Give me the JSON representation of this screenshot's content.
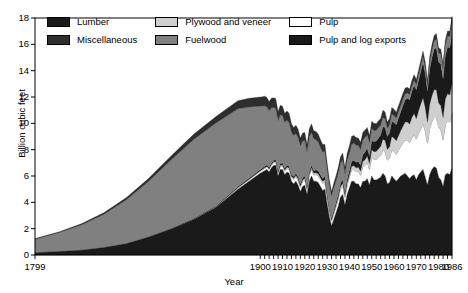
{
  "chart_data": {
    "type": "area",
    "stacked": true,
    "title": "",
    "xlabel": "Year",
    "ylabel": "Billion cubic feet",
    "xlim": [
      1799,
      1986
    ],
    "ylim": [
      0,
      18
    ],
    "yticks": [
      0,
      2,
      4,
      6,
      8,
      10,
      12,
      14,
      16,
      18
    ],
    "xticks": [
      1799,
      1900,
      1910,
      1920,
      1930,
      1940,
      1950,
      1960,
      1970,
      1980,
      1986
    ],
    "grid": false,
    "legend_position": "top-inside",
    "colors": {
      "lumber": "#1a1a1a",
      "miscellaneous": "#2e2e2e",
      "plywood_and_veneer": "#cfcfcf",
      "fuelwood": "#808080",
      "pulp": "#ffffff",
      "pulp_and_log_exports": "#1a1a1a",
      "axis": "#000000",
      "background": "#ffffff"
    },
    "stack_order_bottom_to_top": [
      "Lumber",
      "Pulp",
      "Plywood and veneer",
      "Pulp and log exports",
      "Fuelwood",
      "Miscellaneous"
    ],
    "x": [
      1799,
      1810,
      1820,
      1830,
      1840,
      1850,
      1860,
      1870,
      1880,
      1890,
      1895,
      1900,
      1901,
      1902,
      1903,
      1904,
      1905,
      1906,
      1907,
      1908,
      1909,
      1910,
      1911,
      1912,
      1913,
      1914,
      1915,
      1916,
      1917,
      1918,
      1919,
      1920,
      1921,
      1922,
      1923,
      1924,
      1925,
      1926,
      1927,
      1928,
      1929,
      1930,
      1931,
      1932,
      1933,
      1934,
      1935,
      1936,
      1937,
      1938,
      1939,
      1940,
      1941,
      1942,
      1943,
      1944,
      1945,
      1946,
      1947,
      1948,
      1949,
      1950,
      1951,
      1952,
      1953,
      1954,
      1955,
      1956,
      1957,
      1958,
      1959,
      1960,
      1961,
      1962,
      1963,
      1964,
      1965,
      1966,
      1967,
      1968,
      1969,
      1970,
      1971,
      1972,
      1973,
      1974,
      1975,
      1976,
      1977,
      1978,
      1979,
      1980,
      1981,
      1982,
      1983,
      1984,
      1985,
      1986
    ],
    "series": [
      {
        "name": "Lumber",
        "color": "#1a1a1a",
        "values": [
          0.2,
          0.3,
          0.4,
          0.6,
          0.9,
          1.4,
          2.0,
          2.7,
          3.6,
          5.0,
          5.6,
          6.2,
          6.3,
          6.4,
          6.5,
          6.3,
          6.6,
          6.8,
          6.8,
          6.0,
          6.5,
          6.5,
          6.1,
          6.3,
          6.2,
          5.6,
          5.4,
          5.6,
          5.3,
          4.8,
          5.2,
          5.3,
          4.6,
          5.6,
          6.0,
          5.6,
          5.6,
          5.5,
          5.2,
          4.9,
          5.0,
          3.9,
          2.9,
          2.2,
          2.7,
          3.2,
          3.7,
          4.4,
          4.6,
          3.8,
          4.6,
          5.1,
          5.6,
          5.6,
          5.4,
          5.4,
          5.1,
          5.6,
          5.6,
          5.8,
          5.3,
          6.0,
          5.7,
          5.7,
          5.8,
          5.9,
          6.2,
          6.0,
          5.4,
          5.5,
          6.0,
          5.8,
          5.6,
          5.8,
          6.0,
          6.1,
          6.2,
          6.0,
          5.8,
          6.0,
          6.1,
          5.7,
          6.1,
          6.3,
          6.5,
          5.9,
          5.3,
          6.1,
          6.5,
          6.7,
          6.6,
          5.9,
          5.7,
          5.2,
          6.1,
          6.2,
          6.1,
          6.6
        ]
      },
      {
        "name": "Pulp",
        "color": "#ffffff",
        "values": [
          0.0,
          0.0,
          0.0,
          0.0,
          0.0,
          0.0,
          0.0,
          0.02,
          0.05,
          0.1,
          0.12,
          0.15,
          0.16,
          0.17,
          0.18,
          0.19,
          0.2,
          0.21,
          0.22,
          0.22,
          0.24,
          0.25,
          0.26,
          0.28,
          0.3,
          0.3,
          0.32,
          0.35,
          0.36,
          0.35,
          0.38,
          0.4,
          0.38,
          0.44,
          0.48,
          0.48,
          0.5,
          0.52,
          0.52,
          0.54,
          0.56,
          0.5,
          0.42,
          0.36,
          0.42,
          0.48,
          0.54,
          0.62,
          0.66,
          0.58,
          0.7,
          0.78,
          0.88,
          0.9,
          0.92,
          0.95,
          0.95,
          1.1,
          1.2,
          1.25,
          1.2,
          1.45,
          1.55,
          1.55,
          1.6,
          1.65,
          1.8,
          1.85,
          1.8,
          1.85,
          2.0,
          2.05,
          2.05,
          2.15,
          2.25,
          2.4,
          2.55,
          2.7,
          2.75,
          2.9,
          3.05,
          3.1,
          3.15,
          3.3,
          3.5,
          3.5,
          3.2,
          3.5,
          3.65,
          3.8,
          3.9,
          3.8,
          3.8,
          3.55,
          3.8,
          4.0,
          4.0,
          4.2
        ]
      },
      {
        "name": "Plywood and veneer",
        "color": "#cfcfcf",
        "values": [
          0.0,
          0.0,
          0.0,
          0.0,
          0.0,
          0.0,
          0.0,
          0.0,
          0.0,
          0.02,
          0.03,
          0.05,
          0.05,
          0.06,
          0.06,
          0.06,
          0.07,
          0.07,
          0.08,
          0.07,
          0.08,
          0.09,
          0.09,
          0.1,
          0.1,
          0.09,
          0.1,
          0.11,
          0.11,
          0.1,
          0.11,
          0.12,
          0.11,
          0.13,
          0.14,
          0.14,
          0.15,
          0.15,
          0.15,
          0.16,
          0.16,
          0.14,
          0.12,
          0.1,
          0.12,
          0.14,
          0.16,
          0.18,
          0.19,
          0.17,
          0.2,
          0.22,
          0.26,
          0.28,
          0.3,
          0.32,
          0.32,
          0.4,
          0.44,
          0.46,
          0.45,
          0.55,
          0.6,
          0.62,
          0.66,
          0.7,
          0.8,
          0.84,
          0.82,
          0.88,
          1.0,
          1.02,
          1.02,
          1.1,
          1.18,
          1.28,
          1.35,
          1.4,
          1.4,
          1.55,
          1.6,
          1.55,
          1.7,
          1.85,
          1.95,
          1.8,
          1.6,
          1.85,
          1.95,
          2.05,
          2.05,
          1.85,
          1.85,
          1.7,
          1.95,
          2.05,
          2.05,
          2.2
        ]
      },
      {
        "name": "Pulp and log exports",
        "color": "#1a1a1a",
        "values": [
          0.0,
          0.0,
          0.0,
          0.0,
          0.0,
          0.0,
          0.02,
          0.03,
          0.05,
          0.08,
          0.09,
          0.1,
          0.1,
          0.11,
          0.11,
          0.11,
          0.12,
          0.12,
          0.13,
          0.12,
          0.13,
          0.14,
          0.14,
          0.15,
          0.15,
          0.14,
          0.15,
          0.16,
          0.16,
          0.15,
          0.17,
          0.18,
          0.16,
          0.19,
          0.2,
          0.2,
          0.21,
          0.22,
          0.22,
          0.23,
          0.24,
          0.2,
          0.17,
          0.14,
          0.17,
          0.2,
          0.23,
          0.26,
          0.28,
          0.24,
          0.3,
          0.34,
          0.38,
          0.4,
          0.42,
          0.44,
          0.44,
          0.52,
          0.58,
          0.6,
          0.58,
          0.7,
          0.76,
          0.78,
          0.82,
          0.86,
          0.95,
          1.0,
          0.98,
          1.05,
          1.15,
          1.2,
          1.22,
          1.35,
          1.45,
          1.6,
          1.7,
          1.8,
          1.85,
          2.0,
          2.15,
          2.2,
          2.3,
          2.5,
          2.7,
          2.6,
          2.35,
          2.7,
          2.9,
          3.1,
          3.2,
          3.1,
          3.15,
          2.95,
          3.3,
          3.55,
          3.6,
          3.85
        ]
      },
      {
        "name": "Fuelwood",
        "color": "#808080",
        "values": [
          1.0,
          1.4,
          1.9,
          2.5,
          3.3,
          4.2,
          5.2,
          6.0,
          6.3,
          5.9,
          5.4,
          4.8,
          4.7,
          4.6,
          4.4,
          4.3,
          4.2,
          4.0,
          3.9,
          3.8,
          3.7,
          3.6,
          3.5,
          3.4,
          3.3,
          3.2,
          3.1,
          3.0,
          3.0,
          2.9,
          2.8,
          2.7,
          2.6,
          2.6,
          2.5,
          2.4,
          2.3,
          2.2,
          2.1,
          2.0,
          1.9,
          1.8,
          1.7,
          1.7,
          1.7,
          1.6,
          1.6,
          1.5,
          1.5,
          1.4,
          1.4,
          1.3,
          1.3,
          1.3,
          1.3,
          1.2,
          1.2,
          1.1,
          1.1,
          1.0,
          1.0,
          0.9,
          0.85,
          0.8,
          0.78,
          0.74,
          0.7,
          0.66,
          0.62,
          0.6,
          0.56,
          0.52,
          0.5,
          0.48,
          0.46,
          0.44,
          0.42,
          0.4,
          0.38,
          0.38,
          0.38,
          0.38,
          0.38,
          0.4,
          0.42,
          0.45,
          0.45,
          0.5,
          0.55,
          0.6,
          0.65,
          0.7,
          0.75,
          0.78,
          0.8,
          0.82,
          0.84,
          0.86
        ]
      },
      {
        "name": "Miscellaneous",
        "color": "#2e2e2e",
        "values": [
          0.05,
          0.07,
          0.09,
          0.12,
          0.16,
          0.22,
          0.3,
          0.4,
          0.5,
          0.62,
          0.66,
          0.7,
          0.7,
          0.72,
          0.72,
          0.7,
          0.72,
          0.74,
          0.74,
          0.68,
          0.72,
          0.72,
          0.68,
          0.7,
          0.7,
          0.64,
          0.62,
          0.64,
          0.62,
          0.58,
          0.6,
          0.6,
          0.54,
          0.62,
          0.64,
          0.62,
          0.62,
          0.6,
          0.58,
          0.56,
          0.56,
          0.46,
          0.38,
          0.32,
          0.36,
          0.4,
          0.44,
          0.5,
          0.52,
          0.46,
          0.52,
          0.56,
          0.6,
          0.6,
          0.58,
          0.58,
          0.56,
          0.58,
          0.58,
          0.58,
          0.54,
          0.56,
          0.54,
          0.52,
          0.52,
          0.52,
          0.54,
          0.52,
          0.48,
          0.48,
          0.5,
          0.48,
          0.46,
          0.46,
          0.46,
          0.46,
          0.46,
          0.44,
          0.42,
          0.42,
          0.42,
          0.4,
          0.4,
          0.4,
          0.42,
          0.4,
          0.36,
          0.4,
          0.42,
          0.42,
          0.42,
          0.38,
          0.38,
          0.34,
          0.38,
          0.4,
          0.4,
          0.42
        ]
      }
    ]
  },
  "legend": {
    "items": [
      {
        "label": "Lumber",
        "color": "#1a1a1a"
      },
      {
        "label": "Plywood and veneer",
        "color": "#cfcfcf"
      },
      {
        "label": "Pulp",
        "color": "#ffffff"
      },
      {
        "label": "Miscellaneous",
        "color": "#2e2e2e"
      },
      {
        "label": "Fuelwood",
        "color": "#808080"
      },
      {
        "label": "Pulp and log exports",
        "color": "#1a1a1a"
      }
    ]
  },
  "axes": {
    "ylabel": "Billion cubic feet",
    "xlabel": "Year",
    "yticks": [
      "18",
      "16",
      "14",
      "12",
      "10",
      "8",
      "6",
      "4",
      "2",
      "0"
    ],
    "xticks": [
      "1799",
      "1900",
      "1910",
      "1920",
      "1930",
      "1940",
      "1950",
      "1960",
      "1970",
      "1980",
      "1986"
    ]
  }
}
